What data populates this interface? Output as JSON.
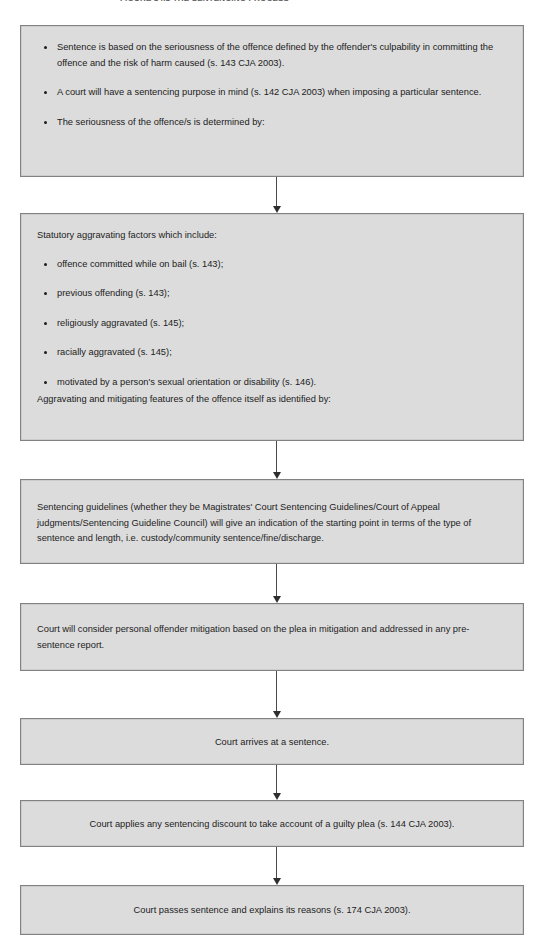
{
  "figure": {
    "caption": "FIGURE 14.1  THE SENTENCING PROCESS"
  },
  "flowchart": {
    "type": "process-flow",
    "orientation": "vertical",
    "colors": {
      "box_fill": "#dcdcdc",
      "box_border": "#828282",
      "page_background": "#ffffff",
      "text": "#1d1d1d",
      "connector": "#4a4a4a"
    },
    "steps": [
      {
        "id": "step-1",
        "layout": "bullets",
        "bullets": [
          "Sentence is based on the seriousness of the offence defined by the offender's culpability in committing the offence and the risk of harm caused (s. 143 CJA 2003).",
          "A court will have a sentencing purpose in mind (s. 142 CJA 2003) when imposing a particular sentence.",
          "The seriousness of the offence/s is determined by:"
        ]
      },
      {
        "id": "step-2",
        "layout": "lead-bullets-tail",
        "lead": "Statutory aggravating factors which include:",
        "bullets": [
          "offence committed while on bail (s. 143);",
          "previous offending (s. 143);",
          "religiously aggravated (s. 145);",
          "racially aggravated (s. 145);",
          "motivated by a person's sexual orientation or disability (s. 146)."
        ],
        "tail": "Aggravating and mitigating features of the offence itself as identified by:"
      },
      {
        "id": "step-3",
        "layout": "paragraph",
        "text": "Sentencing guidelines (whether they be Magistrates' Court Sentencing Guidelines/Court of Appeal judgments/Sentencing Guideline Council) will give an indication of the starting point in terms of the type of sentence and length, i.e. custody/community sentence/fine/discharge."
      },
      {
        "id": "step-4",
        "layout": "paragraph",
        "text": "Court will consider personal offender mitigation based on the plea in mitigation and addressed in any pre-sentence report."
      },
      {
        "id": "step-5",
        "layout": "centered",
        "text": "Court arrives at a sentence."
      },
      {
        "id": "step-6",
        "layout": "centered",
        "text": "Court applies any sentencing discount to take account of a guilty plea (s. 144 CJA 2003)."
      },
      {
        "id": "step-7",
        "layout": "centered",
        "text": "Court passes sentence and explains its reasons (s. 174 CJA 2003)."
      }
    ]
  }
}
